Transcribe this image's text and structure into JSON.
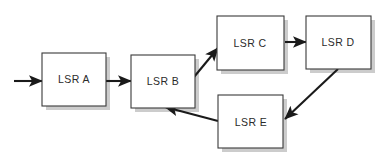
{
  "diagram": {
    "type": "flow-diagram",
    "background_color": "#ffffff",
    "box_fill": "#ffffff",
    "box_border_color": "#3a3a3a",
    "shadow_color": "#b9b9b9",
    "edge_color": "#1a1a1a",
    "label_color": "#2b2b2b",
    "nodes": [
      {
        "id": "A",
        "label": "LSR A",
        "x": 42,
        "y": 53,
        "w": 64,
        "h": 53,
        "label_dx": 32,
        "label_dy": 27
      },
      {
        "id": "B",
        "label": "LSR B",
        "x": 131,
        "y": 55,
        "w": 64,
        "h": 53,
        "label_dx": 32,
        "label_dy": 27
      },
      {
        "id": "C",
        "label": "LSR C",
        "x": 217,
        "y": 16,
        "w": 67,
        "h": 54,
        "label_dx": 33,
        "label_dy": 28
      },
      {
        "id": "D",
        "label": "LSR D",
        "x": 306,
        "y": 16,
        "w": 65,
        "h": 53,
        "label_dx": 32,
        "label_dy": 27
      },
      {
        "id": "E",
        "label": "LSR E",
        "x": 218,
        "y": 95,
        "w": 65,
        "h": 53,
        "label_dx": 33,
        "label_dy": 28
      }
    ],
    "edges": [
      {
        "id": "in-A",
        "from": "external-input",
        "to": "A",
        "x1": 14,
        "y1": 81,
        "x2": 42,
        "y2": 81
      },
      {
        "id": "A-B",
        "from": "A",
        "to": "B",
        "x1": 106,
        "y1": 81,
        "x2": 131,
        "y2": 81
      },
      {
        "id": "B-C",
        "from": "B",
        "to": "C",
        "x1": 194,
        "y1": 77,
        "x2": 218,
        "y2": 48
      },
      {
        "id": "C-D",
        "from": "C",
        "to": "D",
        "x1": 285,
        "y1": 42,
        "x2": 306,
        "y2": 42
      },
      {
        "id": "D-E",
        "from": "D",
        "to": "E",
        "x1": 338,
        "y1": 69,
        "x2": 285,
        "y2": 119
      },
      {
        "id": "E-B",
        "from": "E",
        "to": "B",
        "x1": 218,
        "y1": 121,
        "x2": 165,
        "y2": 107
      }
    ]
  }
}
